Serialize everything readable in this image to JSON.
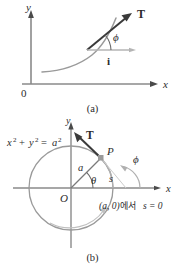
{
  "figure": {
    "colors": {
      "curve": "#9a9a9a",
      "axis": "#8a8a8a",
      "vector": "#3a3a3a",
      "text": "#2b2b2b",
      "point": "#9a9a9a",
      "background": "#ffffff"
    },
    "panels": [
      {
        "id": "a",
        "caption": "(a)",
        "axes": {
          "x_label": "x",
          "y_label": "y",
          "origin_label": "0"
        },
        "labels": {
          "tangent_vector": "T",
          "unit_vector_i": "i",
          "angle": "ϕ"
        }
      },
      {
        "id": "b",
        "caption": "(b)",
        "axes": {
          "x_label": "x",
          "y_label": "y",
          "origin_label": "O"
        },
        "labels": {
          "circle_equation_x2": "x",
          "circle_equation_plus": "+",
          "circle_equation_y2": "y",
          "circle_equation_eq": "=",
          "circle_equation_a2": "a",
          "circle_equation_full": "x² + y² = a²",
          "radius": "a",
          "theta": "θ",
          "arc_length": "s",
          "point_p": "P",
          "tangent_vector": "T",
          "angle_phi": "ϕ",
          "note": "(a, 0)에서  s = 0",
          "note_point": "(a, 0)",
          "note_korean": "에서",
          "note_s": "s = 0"
        }
      }
    ]
  }
}
